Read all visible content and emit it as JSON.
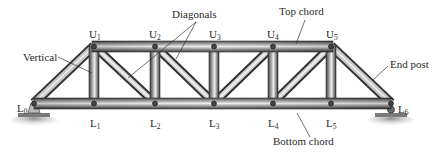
{
  "diagram": {
    "type": "pratt-truss",
    "nodes": {
      "upper": [
        {
          "id": "U1",
          "letter": "U",
          "sub": "1",
          "x": 94,
          "y": 46
        },
        {
          "id": "U2",
          "letter": "U",
          "sub": "2",
          "x": 155,
          "y": 46
        },
        {
          "id": "U3",
          "letter": "U",
          "sub": "3",
          "x": 214,
          "y": 46
        },
        {
          "id": "U4",
          "letter": "U",
          "sub": "4",
          "x": 273,
          "y": 46
        },
        {
          "id": "U5",
          "letter": "U",
          "sub": "5",
          "x": 331,
          "y": 46
        }
      ],
      "lower": [
        {
          "id": "L0",
          "letter": "L",
          "sub": "0",
          "x": 34,
          "y": 103
        },
        {
          "id": "L1",
          "letter": "L",
          "sub": "1",
          "x": 94,
          "y": 103
        },
        {
          "id": "L2",
          "letter": "L",
          "sub": "2",
          "x": 155,
          "y": 103
        },
        {
          "id": "L3",
          "letter": "L",
          "sub": "3",
          "x": 214,
          "y": 103
        },
        {
          "id": "L4",
          "letter": "L",
          "sub": "4",
          "x": 273,
          "y": 103
        },
        {
          "id": "L5",
          "letter": "L",
          "sub": "5",
          "x": 331,
          "y": 103
        },
        {
          "id": "L6",
          "letter": "L",
          "sub": "6",
          "x": 391,
          "y": 103
        }
      ]
    },
    "members": {
      "top_chord": [
        "U1-U2",
        "U2-U3",
        "U3-U4",
        "U4-U5"
      ],
      "bottom_chord": [
        "L0-L1",
        "L1-L2",
        "L2-L3",
        "L3-L4",
        "L4-L5",
        "L5-L6"
      ],
      "end_posts": [
        "L0-U1",
        "U5-L6"
      ],
      "verticals": [
        "U1-L1",
        "U2-L2",
        "U3-L3",
        "U4-L4",
        "U5-L5"
      ],
      "diagonals": [
        "U1-L2",
        "U2-L3",
        "L3-U4",
        "L4-U5"
      ]
    },
    "callouts": {
      "vertical": "Vertical",
      "diagonals": "Diagonals",
      "top_chord": "Top chord",
      "end_post": "End post",
      "bottom_chord": "Bottom chord"
    },
    "colors": {
      "steel_dark": "#3c3c3c",
      "steel_light": "#e6e6e6",
      "steel_mid": "#8a8a8a",
      "ground": "#9a9a9a",
      "text": "#2a2a2a"
    }
  }
}
